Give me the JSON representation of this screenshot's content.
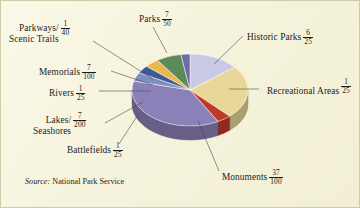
{
  "chart_data": {
    "type": "pie",
    "title": "",
    "source": {
      "prefix": "Source:",
      "text": "National Park Service"
    },
    "legend_position": "callout-labels",
    "value_format": "fraction",
    "categories": [
      "Parks",
      "Historic Parks",
      "Recreational Areas",
      "Monuments",
      "Battlefields",
      "Lakes/ Seashores",
      "Rivers",
      "Memorials",
      "Parkways/ Scenic Trails"
    ],
    "values": [
      0.14,
      0.24,
      0.04,
      0.37,
      0.04,
      0.035,
      0.04,
      0.07,
      0.025
    ],
    "fractions": [
      "7/50",
      "6/25",
      "1/25",
      "37/100",
      "1/25",
      "7/200",
      "1/25",
      "7/100",
      "1/40"
    ],
    "slices": [
      {
        "name": "Parks",
        "num": "7",
        "den": "50",
        "value": 0.14,
        "color": "#c8c9e4"
      },
      {
        "name": "Historic Parks",
        "num": "6",
        "den": "25",
        "value": 0.24,
        "color": "#e9d79a"
      },
      {
        "name": "Recreational Areas",
        "num": "1",
        "den": "25",
        "value": 0.04,
        "color": "#c0392b"
      },
      {
        "name": "Monuments",
        "num": "37",
        "den": "100",
        "value": 0.37,
        "color": "#8b80b8"
      },
      {
        "name": "Battlefields",
        "num": "1",
        "den": "25",
        "value": 0.04,
        "color": "#7c8fc0"
      },
      {
        "name": "Lakes/ Seashores",
        "num": "7",
        "den": "200",
        "value": 0.035,
        "color": "#3d5a96"
      },
      {
        "name": "Rivers",
        "num": "1",
        "den": "25",
        "value": 0.04,
        "color": "#e8b84b"
      },
      {
        "name": "Memorials",
        "num": "7",
        "den": "100",
        "value": 0.07,
        "color": "#5d8a5a"
      },
      {
        "name": "Parkways/ Scenic Trails",
        "num": "1",
        "den": "40",
        "value": 0.025,
        "color": "#6f6aa8"
      }
    ]
  },
  "labels": {
    "parks": {
      "text": "Parks",
      "num": "7",
      "den": "50"
    },
    "historic": {
      "text": "Historic Parks",
      "num": "6",
      "den": "25"
    },
    "recreational": {
      "line1": "Recreational",
      "line2": "Areas",
      "num": "1",
      "den": "25"
    },
    "monuments": {
      "text": "Monuments",
      "num": "37",
      "den": "100"
    },
    "battlefields": {
      "text": "Battlefields",
      "num": "1",
      "den": "25"
    },
    "lakes": {
      "line1": "Lakes/",
      "line2": "Seashores",
      "num": "7",
      "den": "200"
    },
    "rivers": {
      "text": "Rivers",
      "num": "1",
      "den": "25"
    },
    "memorials": {
      "text": "Memorials",
      "num": "7",
      "den": "100"
    },
    "parkways": {
      "line1": "Parkways/",
      "line2": "Scenic Trails",
      "num": "1",
      "den": "40"
    }
  },
  "colors": {
    "background": "#f7f4df",
    "border": "#cfcaa8",
    "leader": "#4a4a4a",
    "text": "#1d1d1d"
  }
}
